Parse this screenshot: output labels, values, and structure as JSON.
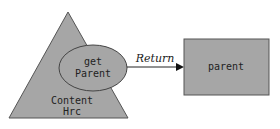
{
  "diagram": {
    "triangle": {
      "label_line1": "Content",
      "label_line2": "Hrc",
      "fill": "#a6a6a6",
      "stroke": "#555555"
    },
    "ellipse": {
      "label_line1": "get",
      "label_line2": "Parent",
      "fill": "#a6a6a6",
      "stroke": "#444444"
    },
    "arrow": {
      "label": "Return",
      "color": "#222222"
    },
    "box": {
      "label": "parent",
      "fill": "#a6a6a6",
      "stroke": "#555555"
    }
  }
}
